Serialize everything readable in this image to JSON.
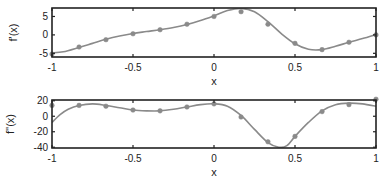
{
  "colors": {
    "frame": "#222222",
    "curve": "#8a8a8a",
    "marker": "#8a8a8a",
    "text": "#222222"
  },
  "chart_data": [
    {
      "type": "line",
      "title": "",
      "xlabel": "x",
      "ylabel": "f'(x)",
      "xlim": [
        -1,
        1
      ],
      "ylim": [
        -6,
        7.3
      ],
      "xticks": [
        -1,
        -0.5,
        0,
        0.5,
        1
      ],
      "xtick_labels": [
        "-1",
        "-0.5",
        "0",
        "0.5",
        "1"
      ],
      "yticks": [
        -5,
        0,
        5
      ],
      "ytick_labels": [
        "-5",
        "0",
        "5"
      ],
      "grid": false,
      "series": [
        {
          "name": "markers",
          "style": "scatter",
          "x": [
            -1,
            -0.833,
            -0.667,
            -0.5,
            -0.333,
            -0.167,
            0,
            0.167,
            0.333,
            0.5,
            0.667,
            0.833,
            1
          ],
          "y": [
            -5.2,
            -3.3,
            -1.3,
            0.3,
            1.4,
            2.9,
            5.0,
            6.3,
            2.9,
            -2.3,
            -4.0,
            -2.0,
            0.0
          ]
        },
        {
          "name": "curve",
          "style": "line",
          "x": [
            -1,
            -0.93,
            -0.833,
            -0.75,
            -0.667,
            -0.583,
            -0.5,
            -0.417,
            -0.333,
            -0.25,
            -0.167,
            -0.083,
            0,
            0.083,
            0.167,
            0.25,
            0.333,
            0.417,
            0.5,
            0.583,
            0.667,
            0.75,
            0.833,
            0.917,
            1
          ],
          "y": [
            -4.9,
            -4.6,
            -3.4,
            -2.3,
            -1.2,
            -0.3,
            0.4,
            0.9,
            1.4,
            2.0,
            2.8,
            3.9,
            5.2,
            6.6,
            7.2,
            6.3,
            3.6,
            0.3,
            -2.4,
            -3.9,
            -4.0,
            -3.1,
            -2.0,
            -1.0,
            0.1
          ]
        }
      ]
    },
    {
      "type": "line",
      "title": "",
      "xlabel": "x",
      "ylabel": "f''(x)",
      "xlim": [
        -1,
        1
      ],
      "ylim": [
        -41,
        21
      ],
      "xticks": [
        -1,
        -0.5,
        0,
        0.5,
        1
      ],
      "xtick_labels": [
        "-1",
        "-0.5",
        "0",
        "0.5",
        "1"
      ],
      "yticks": [
        -40,
        -20,
        0,
        20
      ],
      "ytick_labels": [
        "-40",
        "-20",
        "0",
        "20"
      ],
      "grid": false,
      "series": [
        {
          "name": "markers",
          "style": "scatter",
          "x": [
            -1,
            -0.833,
            -0.667,
            -0.5,
            -0.333,
            -0.167,
            0,
            0.167,
            0.333,
            0.5,
            0.667,
            0.833,
            1
          ],
          "y": [
            14,
            14,
            13,
            8,
            7,
            12,
            16,
            -1,
            -33,
            -26,
            6,
            15,
            22
          ]
        },
        {
          "name": "curve",
          "style": "line",
          "x": [
            -1,
            -0.95,
            -0.9,
            -0.833,
            -0.75,
            -0.667,
            -0.583,
            -0.5,
            -0.417,
            -0.333,
            -0.25,
            -0.167,
            -0.083,
            0,
            0.083,
            0.167,
            0.25,
            0.333,
            0.4,
            0.45,
            0.5,
            0.583,
            0.667,
            0.75,
            0.833,
            0.917,
            1
          ],
          "y": [
            -8,
            2,
            9,
            14,
            16,
            14,
            11,
            8,
            7,
            7,
            9,
            12,
            15,
            16,
            13,
            1,
            -17,
            -34,
            -40,
            -38,
            -26,
            -8,
            7,
            15,
            17,
            16,
            13
          ]
        }
      ]
    }
  ]
}
